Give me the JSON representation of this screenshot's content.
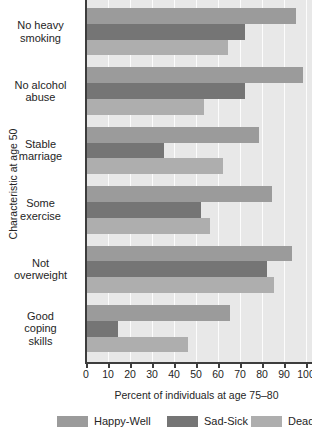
{
  "chart_data": {
    "type": "bar",
    "orientation": "horizontal",
    "xlabel": "Percent of individuals at age 75–80",
    "ylabel": "Characteristic at age 50",
    "xlim": [
      0,
      100
    ],
    "xticks": [
      "0",
      "10",
      "20",
      "30",
      "40",
      "50",
      "60",
      "70",
      "80",
      "90",
      "100"
    ],
    "grid": true,
    "legend_position": "bottom",
    "categories": [
      "No heavy smoking",
      "No alcohol abuse",
      "Stable marriage",
      "Some exercise",
      "Not overweight",
      "Good coping skills"
    ],
    "category_lines": [
      [
        "No heavy",
        "smoking"
      ],
      [
        "No alcohol",
        "abuse"
      ],
      [
        "Stable",
        "marriage"
      ],
      [
        "Some",
        "exercise"
      ],
      [
        "Not",
        "overweight"
      ],
      [
        "Good",
        "coping",
        "skills"
      ]
    ],
    "series": [
      {
        "name": "Happy-Well",
        "color": "#9b9b9b",
        "values": [
          95,
          98,
          78,
          84,
          93,
          65
        ]
      },
      {
        "name": "Sad-Sick",
        "color": "#757575",
        "values": [
          72,
          72,
          35,
          52,
          82,
          14
        ]
      },
      {
        "name": "Dead",
        "color": "#aeaeae",
        "values": [
          64,
          53,
          62,
          56,
          85,
          46
        ]
      }
    ]
  },
  "colors": {
    "plot_background": "#e8e8e8",
    "axis": "#3d3d3d",
    "gridline": "#f7f7f7",
    "text": "#252525"
  }
}
